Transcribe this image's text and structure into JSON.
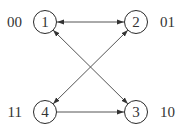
{
  "diagram": {
    "type": "state-transition-graph",
    "colors": {
      "node_stroke": "#2a2a2a",
      "edge": "#555555",
      "text": "#333333",
      "background": "#ffffff"
    },
    "nodes": [
      {
        "id": "1",
        "label": "1",
        "code": "00",
        "cx": 45,
        "cy": 22
      },
      {
        "id": "2",
        "label": "2",
        "code": "01",
        "cx": 136,
        "cy": 22
      },
      {
        "id": "3",
        "label": "3",
        "code": "10",
        "cx": 136,
        "cy": 112
      },
      {
        "id": "4",
        "label": "4",
        "code": "11",
        "cx": 45,
        "cy": 112
      }
    ],
    "edges": [
      {
        "from": "1",
        "to": "2",
        "direction": "both"
      },
      {
        "from": "1",
        "to": "3",
        "direction": "both"
      },
      {
        "from": "2",
        "to": "4",
        "direction": "both"
      },
      {
        "from": "4",
        "to": "3",
        "direction": "forward"
      }
    ]
  }
}
